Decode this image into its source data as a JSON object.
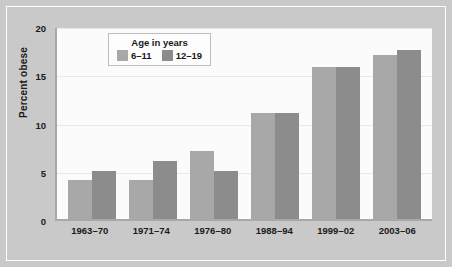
{
  "chart_data": {
    "type": "bar",
    "title": "",
    "subtitle": "",
    "xlabel": "",
    "ylabel": "Percent obese",
    "categories": [
      "1963–70",
      "1971–74",
      "1976–80",
      "1988–94",
      "1999–02",
      "2003–06"
    ],
    "series": [
      {
        "name": "6–11",
        "color": "#a8a8a8",
        "values": [
          4.0,
          4.0,
          7.0,
          11.0,
          15.8,
          17.0
        ]
      },
      {
        "name": "12–19",
        "color": "#8c8c8c",
        "values": [
          5.0,
          6.0,
          5.0,
          11.0,
          15.8,
          17.5
        ]
      }
    ],
    "ylim": [
      0,
      20
    ],
    "yticks": [
      0,
      5,
      10,
      15,
      20
    ],
    "ytick_labels": [
      "0",
      "5",
      "10",
      "15",
      "20"
    ],
    "grid": true,
    "grid_axis": "y",
    "legend": {
      "title": "Age in years",
      "position": "upper-left-inside",
      "entries": [
        "6–11",
        "12–19"
      ]
    }
  },
  "colors": {
    "figure_background": "#c9c9c9",
    "plot_background": "#fbfbfb",
    "axis_line": "#a8a8a8",
    "gridline": "#e8e8e8",
    "text": "#1a1a1a",
    "series_6_11": "#a8a8a8",
    "series_12_19": "#8c8c8c"
  }
}
